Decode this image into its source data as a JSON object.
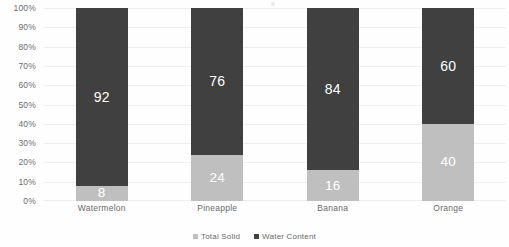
{
  "chart_data": {
    "type": "bar",
    "subtype": "stacked-100-percent",
    "title": "",
    "subtitle": "",
    "xlabel": "",
    "ylabel": "",
    "categories": [
      "Watermelon",
      "Pineapple",
      "Banana",
      "Orange"
    ],
    "series": [
      {
        "name": "Total Solid",
        "color": "#BFBFBF",
        "values": [
          8,
          24,
          16,
          40
        ]
      },
      {
        "name": "Water Content",
        "color": "#404040",
        "values": [
          92,
          76,
          84,
          60
        ]
      }
    ],
    "ylim": [
      0,
      100
    ],
    "ytick_labels": [
      "0%",
      "10%",
      "20%",
      "30%",
      "40%",
      "50%",
      "60%",
      "70%",
      "80%",
      "90%",
      "100%"
    ],
    "ytick_values": [
      0,
      10,
      20,
      30,
      40,
      50,
      60,
      70,
      80,
      90,
      100
    ],
    "grid": true,
    "grid_axis": "y",
    "legend_position": "bottom",
    "data_labels": true,
    "stack_order_bottom_to_top": [
      "Total Solid",
      "Water Content"
    ]
  },
  "legend": {
    "items": [
      {
        "label": "Total Solid",
        "color": "#BFBFBF"
      },
      {
        "label": "Water Content",
        "color": "#404040"
      }
    ]
  },
  "colors": {
    "background": "#FFFFFF",
    "total_solid": "#BFBFBF",
    "water_content": "#404040",
    "gridline": "#F0F0F0",
    "axis_text": "#6D6D6D",
    "data_label_text": "#FFFFFF"
  }
}
